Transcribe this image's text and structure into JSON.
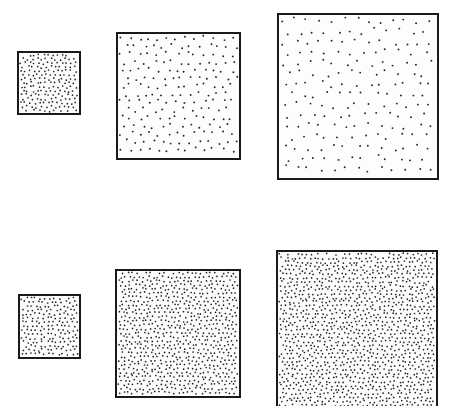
{
  "figure": {
    "background": "#ffffff",
    "border_color": "#1a1a1a",
    "dot_color": "#222222"
  },
  "rows": [
    {
      "name": "constant-count-row",
      "panels": [
        {
          "name": "small",
          "x": 17,
          "y": 51,
          "w": 64,
          "h": 64,
          "spacing": 4.6,
          "dot_r": 0.85,
          "seed": 11
        },
        {
          "name": "medium",
          "x": 116,
          "y": 32,
          "w": 125,
          "h": 128,
          "spacing": 9.2,
          "dot_r": 0.95,
          "seed": 23
        },
        {
          "name": "large",
          "x": 277,
          "y": 13,
          "w": 162,
          "h": 167,
          "spacing": 12.2,
          "dot_r": 0.95,
          "seed": 37
        }
      ]
    },
    {
      "name": "constant-density-row",
      "panels": [
        {
          "name": "small",
          "x": 18,
          "y": 294,
          "w": 63,
          "h": 65,
          "spacing": 4.6,
          "dot_r": 0.85,
          "seed": 41
        },
        {
          "name": "medium",
          "x": 115,
          "y": 269,
          "w": 126,
          "h": 129,
          "spacing": 4.6,
          "dot_r": 0.85,
          "seed": 53
        },
        {
          "name": "large",
          "x": 276,
          "y": 250,
          "w": 162,
          "h": 170,
          "spacing": 4.6,
          "dot_r": 0.85,
          "seed": 67
        }
      ]
    }
  ]
}
